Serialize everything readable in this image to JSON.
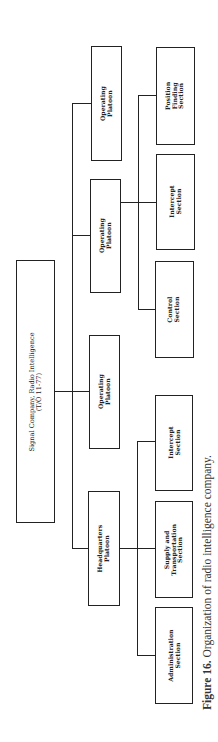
{
  "diagram": {
    "type": "org-chart",
    "orientation": "rotated-90-ccw",
    "root": {
      "label": "Signal Company, Radio Intelligence\n(T/O 11-77)"
    },
    "platoons": [
      {
        "label": "Headquarters\nPlatoon",
        "sections": [
          {
            "label": "Administration\nSection"
          },
          {
            "label": "Supply and\nTransportation\nSection"
          },
          {
            "label": "Intercept\nSection"
          }
        ]
      },
      {
        "label": "Operating\nPlatoon",
        "sections": []
      },
      {
        "label": "Operating\nPlatoon",
        "sections": [
          {
            "label": "Control\nSection"
          },
          {
            "label": "Intercept\nSection"
          },
          {
            "label": "Position\nFinding\nSection"
          }
        ]
      },
      {
        "label": "Operating\nPlatoon",
        "sections": []
      }
    ]
  },
  "caption": {
    "prefix": "Figure 16.",
    "text": " Organization of radio intelligence company."
  }
}
